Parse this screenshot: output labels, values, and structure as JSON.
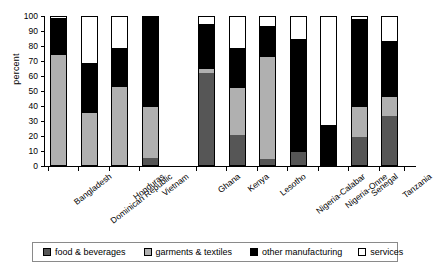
{
  "chart_data": {
    "type": "bar",
    "subtype": "stacked-bar-100",
    "title": "",
    "xlabel": "",
    "ylabel": "percent",
    "ylim": [
      0,
      100
    ],
    "yticks": [
      0,
      10,
      20,
      30,
      40,
      50,
      60,
      70,
      80,
      90,
      100
    ],
    "grid": false,
    "legend_position": "bottom",
    "categories": [
      "Bangladesh",
      "Dominican Republic",
      "Honduras",
      "Vietnam",
      "Ghana",
      "Kenya",
      "Lesotho",
      "Nigeria-Calabar",
      "Nigeria-Onne",
      "Senegal",
      "Tanzania"
    ],
    "groups": [
      {
        "name": "group-1",
        "members": [
          "Bangladesh",
          "Dominican Republic",
          "Honduras",
          "Vietnam"
        ]
      },
      {
        "name": "group-2",
        "members": [
          "Ghana",
          "Kenya",
          "Lesotho",
          "Nigeria-Calabar",
          "Nigeria-Onne",
          "Senegal",
          "Tanzania"
        ]
      }
    ],
    "series": [
      {
        "name": "food & beverages",
        "color": "#565656",
        "values": [
          0,
          0,
          0,
          5,
          62,
          20,
          4,
          9,
          0,
          19,
          33
        ]
      },
      {
        "name": "garments & textiles",
        "color": "#b0b0b0",
        "values": [
          74,
          35,
          53,
          34,
          3,
          32,
          69,
          0,
          0,
          20,
          13
        ]
      },
      {
        "name": "other manufacturing",
        "color": "#000000",
        "values": [
          25,
          34,
          26,
          61,
          30,
          27,
          21,
          76,
          27,
          60,
          38
        ]
      },
      {
        "name": "services",
        "color": "#ffffff",
        "values": [
          1,
          31,
          21,
          0,
          5,
          21,
          6,
          15,
          73,
          1,
          16
        ]
      }
    ]
  },
  "axis": {
    "y_label": "percent",
    "y_ticks": [
      "100",
      "90",
      "80",
      "70",
      "60",
      "50",
      "40",
      "30",
      "20",
      "10",
      "0"
    ]
  },
  "legend": {
    "items": [
      {
        "label": "food & beverages",
        "color": "#565656"
      },
      {
        "label": "garments & textiles",
        "color": "#b0b0b0"
      },
      {
        "label": "other manufacturing",
        "color": "#000000"
      },
      {
        "label": "services",
        "color": "#ffffff"
      }
    ]
  }
}
